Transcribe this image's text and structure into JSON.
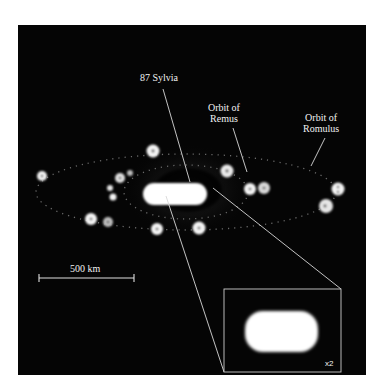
{
  "figure": {
    "background_color": "#050505",
    "labels": {
      "primary_body": "87 Sylvia",
      "inner_orbit_line1": "Orbit of",
      "inner_orbit_line2": "Remus",
      "outer_orbit_line1": "Orbit of",
      "outer_orbit_line2": "Romulus",
      "scale_bar": "500 km",
      "inset_magnification": "x2"
    },
    "scale_bar": {
      "x1": 39,
      "x2": 134,
      "y": 278,
      "length_label": "500 km"
    },
    "orbits": [
      {
        "name": "Romulus",
        "cx": 186,
        "cy": 192,
        "rx": 150,
        "ry": 38
      },
      {
        "name": "Remus",
        "cx": 186,
        "cy": 192,
        "rx": 62,
        "ry": 27
      }
    ],
    "moon_positions": [
      [
        42,
        176
      ],
      [
        91,
        219
      ],
      [
        108,
        222
      ],
      [
        110,
        188
      ],
      [
        113,
        197
      ],
      [
        120,
        178
      ],
      [
        130,
        173
      ],
      [
        153,
        151
      ],
      [
        157,
        229
      ],
      [
        199,
        228
      ],
      [
        227,
        171
      ],
      [
        250,
        189
      ],
      [
        264,
        188
      ],
      [
        326,
        206
      ],
      [
        338,
        189
      ]
    ],
    "inset": {
      "x": 224,
      "y": 289,
      "width": 117,
      "height": 83,
      "magnification": "x2"
    }
  }
}
